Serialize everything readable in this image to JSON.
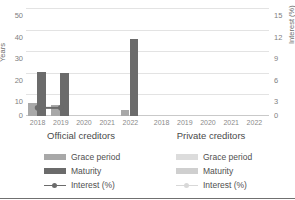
{
  "chart_data": {
    "type": "bar",
    "title": "",
    "subtitle": "",
    "xlabel": "",
    "ylabel": "Years",
    "ylabel_secondary": "Interest (%)",
    "ylim": [
      0,
      50
    ],
    "ylim_secondary": [
      0,
      15
    ],
    "yticks": [
      "0",
      "10",
      "20",
      "30",
      "40",
      "50"
    ],
    "yticks_secondary": [
      "0",
      "3",
      "6",
      "9",
      "12",
      "15"
    ],
    "grid": true,
    "legend_position": "bottom",
    "categories": [
      "2018",
      "2019",
      "2020",
      "2021",
      "2022"
    ],
    "panels": [
      {
        "name": "Official creditors",
        "series": [
          {
            "name": "Grace period",
            "axis": "left",
            "unit": "Years",
            "values": [
              6.3,
              5.2,
              0,
              0,
              3.0
            ]
          },
          {
            "name": "Maturity",
            "axis": "left",
            "unit": "Years",
            "values": [
              20.5,
              20.0,
              0,
              0,
              36.0
            ]
          },
          {
            "name": "Interest (%)",
            "axis": "right",
            "unit": "Interest (%)",
            "values": [
              1.0,
              1.0,
              null,
              null,
              null
            ]
          }
        ]
      },
      {
        "name": "Private creditors",
        "series": [
          {
            "name": "Grace period",
            "axis": "left",
            "unit": "Years",
            "values": [
              0,
              0,
              0,
              0,
              0
            ]
          },
          {
            "name": "Maturity",
            "axis": "left",
            "unit": "Years",
            "values": [
              0,
              0,
              0,
              0,
              0
            ]
          },
          {
            "name": "Interest (%)",
            "axis": "right",
            "unit": "Interest (%)",
            "values": [
              null,
              null,
              null,
              null,
              null
            ]
          }
        ]
      }
    ],
    "colors": {
      "grace_period": "#a8a8a8",
      "maturity": "#6b6b6b",
      "interest_line": "#6b6b6b",
      "grace_period_faded": "#dcdcdc",
      "maturity_faded": "#cfcfcf",
      "interest_line_faded": "#d8d8d8",
      "gridline": "#e3e3e3",
      "axis": "#c9c9c9",
      "text": "#595959"
    }
  },
  "axes": {
    "left": {
      "title": "Years",
      "ticks": [
        "50",
        "40",
        "30",
        "20",
        "10",
        "0"
      ]
    },
    "right": {
      "title": "Interest (%)",
      "ticks": [
        "15",
        "12",
        "9",
        "6",
        "3",
        "0"
      ]
    }
  },
  "panels": {
    "official": {
      "title": "Official creditors",
      "xticks": [
        "2018",
        "2019",
        "2020",
        "2021",
        "2022"
      ]
    },
    "private": {
      "title": "Private creditors",
      "xticks": [
        "2018",
        "2019",
        "2020",
        "2021",
        "2022"
      ]
    }
  },
  "legend": {
    "official": [
      {
        "label": "Grace period",
        "marker": "swatch-bar"
      },
      {
        "label": "Maturity",
        "marker": "swatch-bar"
      },
      {
        "label": "Interest (%)",
        "marker": "line-marker-icon"
      }
    ],
    "private": [
      {
        "label": "Grace period",
        "marker": "swatch-bar"
      },
      {
        "label": "Maturity",
        "marker": "swatch-bar"
      },
      {
        "label": "Interest (%)",
        "marker": "line-marker-icon"
      }
    ]
  }
}
